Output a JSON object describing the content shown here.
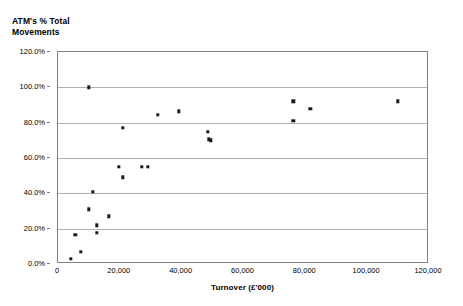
{
  "chart_data": {
    "type": "scatter",
    "title": "ATM's % Total\nMovements",
    "xlabel": "Turnover (£'000)",
    "ylabel": "ATM's % Total Movements",
    "xlim": [
      0,
      120000
    ],
    "ylim": [
      0,
      1.2
    ],
    "grid": true,
    "legend": false,
    "x_ticks": [
      0,
      20000,
      40000,
      60000,
      80000,
      100000,
      120000
    ],
    "x_tick_labels": [
      "0",
      "20,000",
      "40,000",
      "60,000",
      "80,000",
      "100,000",
      "120,000"
    ],
    "y_ticks": [
      0.0,
      0.2,
      0.4,
      0.6,
      0.8,
      1.0,
      1.2
    ],
    "y_tick_labels": [
      "0.0%",
      "20.0%",
      "40.0%",
      "60.0%",
      "80.0%",
      "100.0%",
      "120.0%"
    ],
    "marker": "square",
    "marker_color": "#1a1a1a",
    "points": [
      {
        "x": 4200,
        "y": 0.03
      },
      {
        "x": 5600,
        "y": 0.165
      },
      {
        "x": 7400,
        "y": 0.07
      },
      {
        "x": 11300,
        "y": 0.41
      },
      {
        "x": 9900,
        "y": 0.31
      },
      {
        "x": 12600,
        "y": 0.22
      },
      {
        "x": 12600,
        "y": 0.175
      },
      {
        "x": 10000,
        "y": 1.0
      },
      {
        "x": 16500,
        "y": 0.27
      },
      {
        "x": 21000,
        "y": 0.77
      },
      {
        "x": 19700,
        "y": 0.55
      },
      {
        "x": 21000,
        "y": 0.49
      },
      {
        "x": 27100,
        "y": 0.55
      },
      {
        "x": 29000,
        "y": 0.55
      },
      {
        "x": 32300,
        "y": 0.845
      },
      {
        "x": 39000,
        "y": 0.865
      },
      {
        "x": 48400,
        "y": 0.75
      },
      {
        "x": 48700,
        "y": 0.705
      },
      {
        "x": 49500,
        "y": 0.7
      },
      {
        "x": 76100,
        "y": 0.92
      },
      {
        "x": 76100,
        "y": 0.81
      },
      {
        "x": 81600,
        "y": 0.88
      },
      {
        "x": 110000,
        "y": 0.92
      }
    ]
  }
}
